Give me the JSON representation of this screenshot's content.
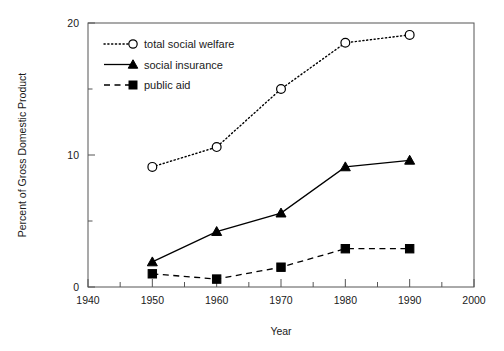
{
  "chart_data": {
    "type": "line",
    "title": "",
    "xlabel": "Year",
    "ylabel": "Percent of Gross Domestic Product",
    "x": [
      1950,
      1960,
      1970,
      1980,
      1990
    ],
    "xlim": [
      1940,
      2000
    ],
    "ylim": [
      0,
      20
    ],
    "xticks": [
      1940,
      1950,
      1960,
      1970,
      1980,
      1990,
      2000
    ],
    "xtick_labels": [
      "1940",
      "1950",
      "1960",
      "1970",
      "1980",
      "1990",
      "2000"
    ],
    "xminor_ticks": [
      1945,
      1955,
      1965,
      1975,
      1985,
      1995
    ],
    "yticks": [
      0,
      10,
      20
    ],
    "ytick_labels": [
      "0",
      "10",
      "20"
    ],
    "yminor_ticks": [
      5,
      15
    ],
    "grid": false,
    "legend_position": "upper left inside",
    "series": [
      {
        "name": "total social welfare",
        "values": [
          9.1,
          10.6,
          15.0,
          18.5,
          19.1
        ],
        "marker": "open-circle",
        "linestyle": "dotted",
        "color": "#000000"
      },
      {
        "name": "social insurance",
        "values": [
          1.9,
          4.2,
          5.6,
          9.1,
          9.6
        ],
        "marker": "filled-triangle",
        "linestyle": "solid",
        "color": "#000000"
      },
      {
        "name": "public aid",
        "values": [
          1.0,
          0.6,
          1.5,
          2.9,
          2.9
        ],
        "marker": "filled-square",
        "linestyle": "dashed",
        "color": "#000000"
      }
    ]
  },
  "axes": {
    "ylabel": "Percent of Gross Domestic Product",
    "xlabel": "Year",
    "ytick_labels": [
      "0",
      "10",
      "20"
    ],
    "xtick_labels": [
      "1940",
      "1950",
      "1960",
      "1970",
      "1980",
      "1990",
      "2000"
    ]
  },
  "legend": {
    "items": [
      {
        "label": "total social welfare"
      },
      {
        "label": "social insurance"
      },
      {
        "label": "public aid"
      }
    ]
  }
}
